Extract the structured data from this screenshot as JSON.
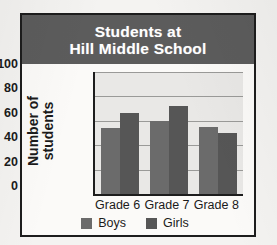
{
  "figure": {
    "frame_border_color": "#1d1d1d",
    "paper_color": "#f4f3f1"
  },
  "banner": {
    "line1": "Students at",
    "line2": "Hill Middle School",
    "background": "#5c5c5c",
    "text_color": "#ffffff"
  },
  "axis": {
    "ylabel_line1": "Number of",
    "ylabel_line2": "students",
    "ticks": [
      "100",
      "80",
      "60",
      "40",
      "20",
      "0"
    ]
  },
  "legend": {
    "items": [
      {
        "label": "Boys",
        "color": "#6b6b6b"
      },
      {
        "label": "Girls",
        "color": "#565656"
      }
    ]
  },
  "categories": [
    {
      "label": "Grade 6"
    },
    {
      "label": "Grade 7"
    },
    {
      "label": "Grade 8"
    }
  ],
  "chart_data": {
    "type": "bar",
    "title": "Students at Hill Middle School",
    "xlabel": "",
    "ylabel": "Number of students",
    "categories": [
      "Grade 6",
      "Grade 7",
      "Grade 8"
    ],
    "series": [
      {
        "name": "Boys",
        "color": "#6b6b6b",
        "values": [
          54,
          60,
          55
        ]
      },
      {
        "name": "Girls",
        "color": "#565656",
        "values": [
          66,
          72,
          50
        ]
      }
    ],
    "ylim": [
      0,
      100
    ],
    "ytick_step": 20,
    "yticks": [
      0,
      20,
      40,
      60,
      80,
      100
    ],
    "grid": true,
    "legend_position": "bottom"
  }
}
